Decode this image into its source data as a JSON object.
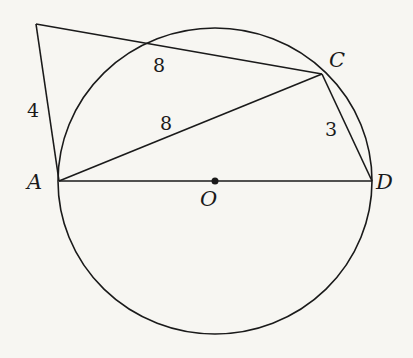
{
  "diagram": {
    "colors": {
      "background": "#f7f6f2",
      "stroke": "#1a1a1a"
    },
    "points": {
      "A": {
        "label": "A",
        "x": 59,
        "y": 181
      },
      "D": {
        "label": "D",
        "x": 372,
        "y": 181
      },
      "O": {
        "label": "O",
        "x": 215,
        "y": 181
      },
      "C": {
        "label": "C",
        "x": 322,
        "y": 74
      },
      "P": {
        "label": "",
        "x": 36,
        "y": 24
      },
      "E": {
        "label": "",
        "x": 153,
        "y": 44
      }
    },
    "circle": {
      "cx": 215,
      "cy": 181,
      "rx": 157,
      "ry": 153
    },
    "segment_labels": {
      "PA": "4",
      "EC": "8",
      "AC": "8",
      "CD": "3"
    }
  }
}
